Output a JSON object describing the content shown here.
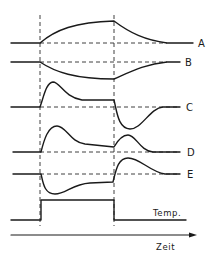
{
  "diagram": {
    "type": "timing-diagram",
    "event_markers": [
      {
        "name": "pulse-start",
        "x": 40
      },
      {
        "name": "pulse-end",
        "x": 114
      }
    ],
    "traces": [
      {
        "id": "A",
        "label": "A",
        "shape": "rises slowly during pulse, decays back to baseline after pulse"
      },
      {
        "id": "B",
        "label": "B",
        "shape": "falls slowly during pulse, recovers to baseline after pulse"
      },
      {
        "id": "C",
        "label": "C",
        "shape": "positive overshoot at pulse start settling to elevated plateau; negative undershoot at pulse end"
      },
      {
        "id": "D",
        "label": "D",
        "shape": "positive peak at pulse start decaying; smaller positive bump at pulse end"
      },
      {
        "id": "E",
        "label": "E",
        "shape": "negative dip at pulse start recovering; positive peak at pulse end"
      },
      {
        "id": "Temp",
        "label": "Temp.",
        "shape": "rectangular step pulse"
      }
    ],
    "x_axis": {
      "label": "Zeit",
      "arrow": true
    }
  }
}
